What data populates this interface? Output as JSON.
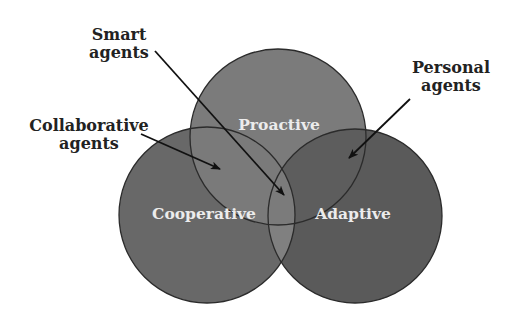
{
  "diagram": {
    "type": "venn",
    "circles": [
      {
        "id": "proactive",
        "label": "Proactive",
        "cx": 278,
        "cy": 137,
        "r": 88,
        "fill": "#7b7b7b"
      },
      {
        "id": "cooperative",
        "label": "Cooperative",
        "cx": 207,
        "cy": 215,
        "r": 88,
        "fill": "#686868"
      },
      {
        "id": "adaptive",
        "label": "Adaptive",
        "cx": 355,
        "cy": 216,
        "r": 87,
        "fill": "#5a5a5a"
      }
    ],
    "overlap_colors": {
      "proactive_cooperative": "#7a7a7a",
      "proactive_adaptive": "#5d5d5d",
      "cooperative_adaptive": "#808080",
      "all_three": "#7b7b7b"
    },
    "outline_color": "#2b2b2b",
    "callouts": [
      {
        "id": "smart-agents",
        "lines": [
          "Smart",
          "agents"
        ],
        "target": "Proactive ∩ Cooperative ∩ Adaptive"
      },
      {
        "id": "collaborative-agents",
        "lines": [
          "Collaborative",
          "agents"
        ],
        "target": "Proactive ∩ Cooperative"
      },
      {
        "id": "personal-agents",
        "lines": [
          "Personal",
          "agents"
        ],
        "target": "Proactive ∩ Adaptive"
      }
    ]
  }
}
